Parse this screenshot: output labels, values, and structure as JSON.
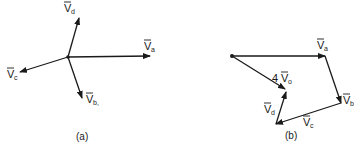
{
  "diagram_a": {
    "caption": "(a)",
    "origin": [
      68,
      57
    ],
    "vectors": [
      {
        "name": "V_a",
        "base": "V",
        "sub": "a",
        "tip": [
          150,
          56
        ],
        "label_pos": [
          144,
          50
        ]
      },
      {
        "name": "V_b",
        "base": "V",
        "sub": "b,",
        "tip": [
          82,
          98
        ],
        "label_pos": [
          86,
          103
        ]
      },
      {
        "name": "V_c",
        "base": "V",
        "sub": "c",
        "tip": [
          20,
          72
        ],
        "label_pos": [
          7,
          78
        ]
      },
      {
        "name": "V_d",
        "base": "V",
        "sub": "d",
        "tip": [
          79,
          18
        ],
        "label_pos": [
          64,
          12
        ]
      }
    ]
  },
  "diagram_b": {
    "caption": "(b)",
    "start": [
      232,
      56
    ],
    "vectors": [
      {
        "name": "V_a",
        "base": "V",
        "sub": "a",
        "from": [
          232,
          56
        ],
        "to": [
          325,
          56
        ],
        "label_pos": [
          317,
          49
        ]
      },
      {
        "name": "V_b",
        "base": "V",
        "sub": "b",
        "from": [
          325,
          56
        ],
        "to": [
          341,
          103
        ],
        "label_pos": [
          343,
          104
        ]
      },
      {
        "name": "V_c",
        "base": "V",
        "sub": "c",
        "from": [
          341,
          103
        ],
        "to": [
          276,
          124
        ],
        "label_pos": [
          303,
          126
        ]
      },
      {
        "name": "V_d",
        "base": "V",
        "sub": "d",
        "from": [
          276,
          124
        ],
        "to": [
          286,
          92
        ],
        "label_pos": [
          264,
          113
        ]
      },
      {
        "name": "4V_o",
        "base": "V",
        "coef": "4",
        "sub": "o",
        "from": [
          232,
          56
        ],
        "to": [
          285,
          89
        ],
        "label_pos": [
          272,
          82
        ]
      }
    ]
  }
}
